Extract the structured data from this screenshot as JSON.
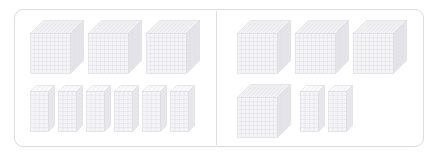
{
  "figure": {
    "type": "base-ten-blocks-comparison",
    "background_color": "#ffffff",
    "card": {
      "border_color": "#dcdcdc",
      "radius_px": 9
    },
    "divider": {
      "color": "#dcdcdc",
      "orientation": "vertical"
    },
    "block_colors": {
      "face_front": "#f4f4f6",
      "face_top": "#fafafb",
      "face_side": "#e8e8ec",
      "grid_line": "#dcdce2",
      "edge_line": "#d2d2d8"
    },
    "watermark_text": "UU"
  },
  "panels": [
    {
      "id": "left",
      "label": "Left quantity",
      "rows": [
        {
          "id": "left-thousands",
          "block_type": "thousand-cube",
          "unit_value": 1000,
          "count": 3
        },
        {
          "id": "left-hundreds",
          "block_type": "hundred-flat",
          "unit_value": 100,
          "count": 6
        }
      ],
      "total": 3600
    },
    {
      "id": "right",
      "label": "Right quantity",
      "rows": [
        {
          "id": "right-thousands-top",
          "block_type": "thousand-cube",
          "unit_value": 1000,
          "count": 3
        },
        {
          "id": "right-thousands-bottom",
          "block_type": "thousand-cube",
          "unit_value": 1000,
          "count": 1
        },
        {
          "id": "right-hundreds",
          "block_type": "hundred-flat",
          "unit_value": 100,
          "count": 2
        }
      ],
      "total": 4200
    }
  ],
  "chart_data": {
    "type": "bar",
    "xlabel": "",
    "ylabel": "Value",
    "categories": [
      "Left",
      "Right"
    ],
    "series": [
      {
        "name": "Thousand cubes",
        "values": [
          3,
          4
        ]
      },
      {
        "name": "Hundred flats",
        "values": [
          6,
          2
        ]
      }
    ],
    "values": [
      3600,
      4200
    ],
    "ylim": [
      0,
      5000
    ],
    "grid": false,
    "legend": "none"
  },
  "layout": {
    "cubes": {
      "left_top": [
        {
          "x": 30,
          "y": 20
        },
        {
          "x": 88,
          "y": 20
        },
        {
          "x": 146,
          "y": 20
        }
      ],
      "right_top": [
        {
          "x": 237,
          "y": 20
        },
        {
          "x": 295,
          "y": 20
        },
        {
          "x": 353,
          "y": 20
        }
      ],
      "right_bottom": [
        {
          "x": 237,
          "y": 84
        }
      ]
    },
    "flats": {
      "left_bottom": [
        {
          "x": 30,
          "y": 85
        },
        {
          "x": 58,
          "y": 85
        },
        {
          "x": 86,
          "y": 85
        },
        {
          "x": 114,
          "y": 85
        },
        {
          "x": 142,
          "y": 85
        },
        {
          "x": 170,
          "y": 85
        }
      ],
      "right_bottom": [
        {
          "x": 300,
          "y": 85
        },
        {
          "x": 328,
          "y": 85
        }
      ]
    }
  }
}
